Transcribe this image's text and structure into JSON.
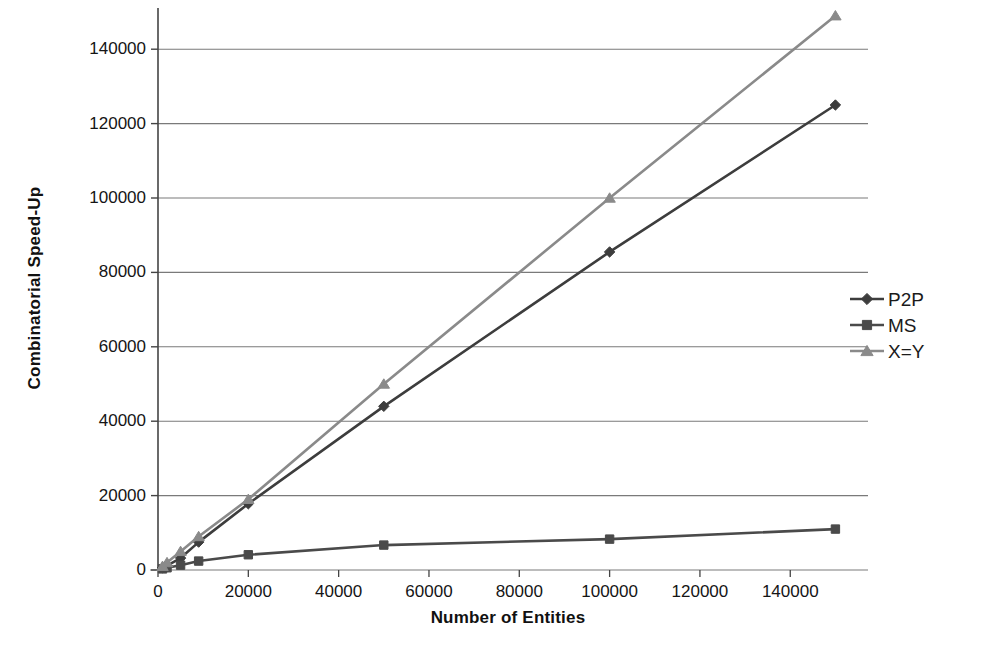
{
  "chart_data": {
    "type": "line",
    "title": "",
    "xlabel": "Number of Entities",
    "ylabel": "Combinatorial Speed-Up",
    "xlim": [
      0,
      155000
    ],
    "ylim": [
      0,
      150000
    ],
    "xticks": [
      0,
      20000,
      40000,
      60000,
      80000,
      100000,
      120000,
      140000
    ],
    "xtick_labels": [
      "0",
      "20000",
      "40000",
      "60000",
      "80000",
      "100000",
      "120000",
      "140000"
    ],
    "yticks": [
      0,
      20000,
      40000,
      60000,
      80000,
      100000,
      120000,
      140000
    ],
    "ytick_labels": [
      "0",
      "20000",
      "40000",
      "60000",
      "80000",
      "100000",
      "120000",
      "140000"
    ],
    "grid": "horizontal",
    "legend_position": "right",
    "x": [
      1000,
      2000,
      5000,
      9000,
      20000,
      50000,
      100000,
      150000
    ],
    "series": [
      {
        "name": "P2P",
        "marker": "diamond",
        "color": "#3d3d3d",
        "values": [
          600,
          1200,
          3200,
          7500,
          17800,
          44000,
          85500,
          125000
        ]
      },
      {
        "name": "MS",
        "marker": "square",
        "color": "#4a4a4a",
        "values": [
          300,
          600,
          1300,
          2400,
          4100,
          6700,
          8300,
          11000
        ]
      },
      {
        "name": "X=Y",
        "marker": "triangle",
        "color": "#8a8a8a",
        "values": [
          1000,
          2000,
          5000,
          9000,
          19000,
          50000,
          100000,
          149000
        ]
      }
    ]
  },
  "legend": {
    "items": [
      {
        "label": "P2P",
        "marker": "diamond",
        "color": "#3d3d3d"
      },
      {
        "label": "MS",
        "marker": "square",
        "color": "#4a4a4a"
      },
      {
        "label": "X=Y",
        "marker": "triangle",
        "color": "#8a8a8a"
      }
    ]
  },
  "axes": {
    "x_title": "Number of Entities",
    "y_title": "Combinatorial Speed-Up"
  },
  "colors": {
    "background": "#ffffff",
    "axis": "#444444",
    "grid": "#7a7a7a",
    "p2p": "#3d3d3d",
    "ms": "#4a4a4a",
    "xy": "#8a8a8a"
  }
}
